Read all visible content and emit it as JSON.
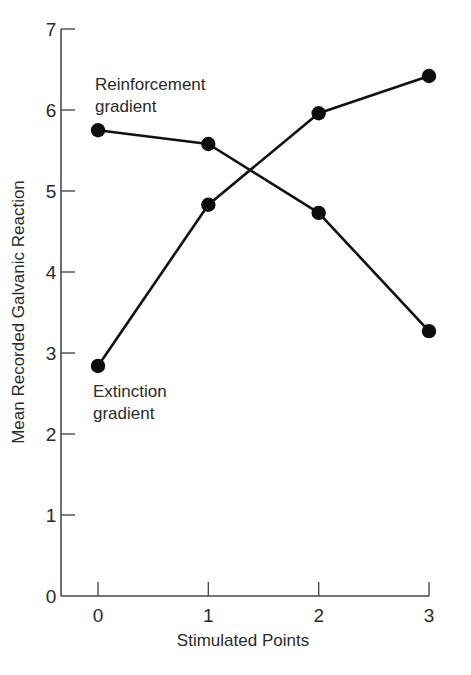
{
  "chart_data": {
    "type": "line",
    "title": "",
    "xlabel": "Stimulated Points",
    "ylabel": "Mean Recorded Galvanic Reaction",
    "x": [
      0,
      1,
      2,
      3
    ],
    "x_tick_labels": [
      "0",
      "1",
      "2",
      "3"
    ],
    "y_ticks": [
      0,
      1,
      2,
      3,
      4,
      5,
      6,
      7
    ],
    "y_tick_labels": [
      "0",
      "1",
      "2",
      "3",
      "4",
      "5",
      "6",
      "7"
    ],
    "xlim": [
      -0.35,
      3
    ],
    "ylim": [
      0,
      7
    ],
    "grid": false,
    "legend": "none (series labeled by inline annotations)",
    "series": [
      {
        "name": "Reinforcement gradient",
        "values": [
          5.75,
          5.58,
          4.73,
          3.27
        ],
        "marker": "filled-circle",
        "color": "#111111"
      },
      {
        "name": "Extinction gradient",
        "values": [
          2.84,
          4.83,
          5.96,
          6.42
        ],
        "marker": "filled-circle",
        "color": "#111111"
      }
    ],
    "annotations": [
      {
        "lines": [
          "Reinforcement",
          "gradient"
        ],
        "near": "x=0, y≈6"
      },
      {
        "lines": [
          "Extinction",
          "gradient"
        ],
        "near": "x=0, y≈2.5"
      }
    ]
  },
  "labels": {
    "xlabel": "Stimulated Points",
    "ylabel": "Mean Recorded Galvanic Reaction",
    "reinforcement_line1": "Reinforcement",
    "reinforcement_line2": "gradient",
    "extinction_line1": "Extinction",
    "extinction_line2": "gradient"
  }
}
